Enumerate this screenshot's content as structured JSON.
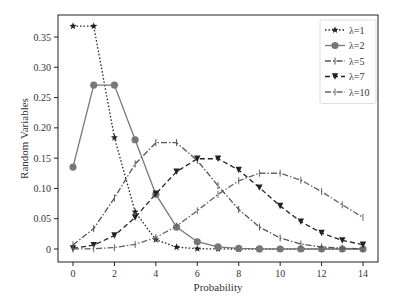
{
  "chart_data": {
    "type": "line",
    "title": "",
    "xlabel": "Probability",
    "ylabel": "Random Variables",
    "xlim": [
      -0.7,
      14.7
    ],
    "ylim": [
      -0.018,
      0.386
    ],
    "xticks": [
      0,
      2,
      4,
      6,
      8,
      10,
      12,
      14
    ],
    "xtick_labels": [
      "0",
      "2",
      "4",
      "6",
      "8",
      "10",
      "12",
      "14"
    ],
    "yticks": [
      0,
      0.05,
      0.1,
      0.15,
      0.2,
      0.25,
      0.3,
      0.35
    ],
    "ytick_labels": [
      "0",
      "0.05",
      "0.10",
      "0.15",
      "0.20",
      "0.25",
      "0.30",
      "0.35"
    ],
    "grid": false,
    "legend_position": "upper right",
    "x": [
      0,
      1,
      2,
      3,
      4,
      5,
      6,
      7,
      8,
      9,
      10,
      11,
      12,
      13,
      14
    ],
    "series": [
      {
        "name": "λ=1",
        "style": "dotted",
        "marker": "star",
        "color": "#222222",
        "values": [
          0.3679,
          0.3679,
          0.1839,
          0.0613,
          0.0153,
          0.0031,
          0.0005,
          0.0001,
          0.0,
          0.0,
          0.0,
          0.0,
          0.0,
          0.0,
          0.0
        ]
      },
      {
        "name": "λ=2",
        "style": "solid",
        "marker": "circle",
        "color": "#777777",
        "values": [
          0.1353,
          0.2707,
          0.2707,
          0.1804,
          0.0902,
          0.0361,
          0.012,
          0.0034,
          0.0009,
          0.0002,
          0.0,
          0.0,
          0.0,
          0.0,
          0.0
        ]
      },
      {
        "name": "λ=5",
        "style": "dashdot",
        "marker": "tick",
        "color": "#555555",
        "values": [
          0.0067,
          0.0337,
          0.0842,
          0.1404,
          0.1755,
          0.1755,
          0.1462,
          0.1044,
          0.0653,
          0.0363,
          0.0181,
          0.0082,
          0.0034,
          0.0013,
          0.0005
        ]
      },
      {
        "name": "λ=7",
        "style": "dashed",
        "marker": "triangle-down",
        "color": "#222222",
        "values": [
          0.0009,
          0.0064,
          0.0223,
          0.0521,
          0.0912,
          0.1277,
          0.149,
          0.149,
          0.1304,
          0.1014,
          0.071,
          0.0452,
          0.0263,
          0.0142,
          0.0071
        ]
      },
      {
        "name": "λ=10",
        "style": "dashdot",
        "marker": "plus",
        "color": "#666666",
        "values": [
          0.0,
          0.0005,
          0.0023,
          0.0076,
          0.0189,
          0.0378,
          0.0631,
          0.0901,
          0.1126,
          0.1251,
          0.1251,
          0.1137,
          0.0948,
          0.0729,
          0.0521
        ]
      }
    ]
  }
}
